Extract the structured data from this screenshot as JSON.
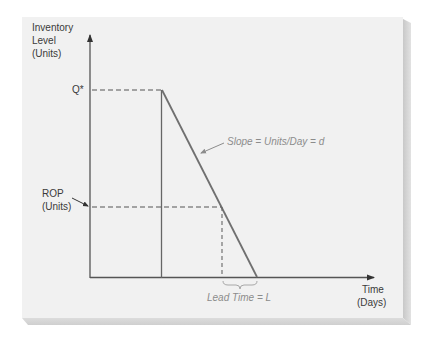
{
  "diagram": {
    "y_axis_label": [
      "Inventory",
      "Level",
      "(Units)"
    ],
    "x_axis_label": [
      "Time",
      "(Days)"
    ],
    "q_star_label": "Q*",
    "rop_label": [
      "ROP",
      "(Units)"
    ],
    "slope_label": "Slope = Units/Day = d",
    "lead_time_label": "Lead Time = L",
    "colors": {
      "page": "#f1f1f1",
      "axis": "#555555",
      "annotation": "#8c8c8c",
      "brace": "#a8a8a8"
    }
  }
}
